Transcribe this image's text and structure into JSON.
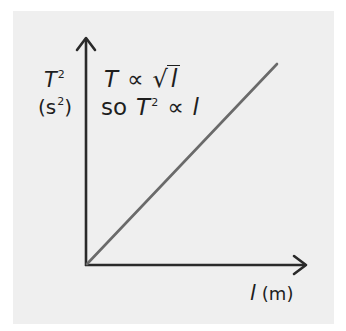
{
  "figure": {
    "background_color": "#efefef",
    "axis_color": "#2a2a2a",
    "line_color": "#6a6a6a",
    "y_axis": {
      "variable": "T",
      "exponent": "2",
      "unit_open": "(s",
      "unit_exponent": "2",
      "unit_close": ")"
    },
    "x_axis": {
      "variable": "l",
      "unit": "(m)"
    },
    "relations": {
      "line1": {
        "lhs": "T",
        "symbol": "∝",
        "sqrt_sign": "√",
        "rhs": "l"
      },
      "line2": {
        "prefix": "so",
        "lhs": "T",
        "lhs_exponent": "2",
        "symbol": "∝",
        "rhs": "l"
      }
    },
    "graph": {
      "type": "line",
      "description": "Straight line through the origin showing T² directly proportional to l",
      "origin": [
        0,
        0
      ],
      "slope": "positive, constant"
    }
  }
}
